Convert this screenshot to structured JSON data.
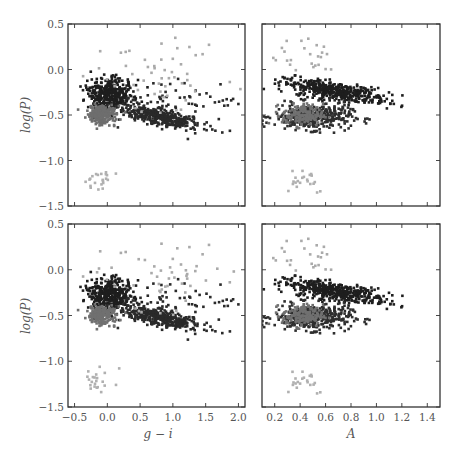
{
  "figure": {
    "clipped_top_text": [
      "y",
      "p"
    ]
  },
  "chart_data": {
    "type": "scatter",
    "layout": "2x2 grid, shared y-axis per row, shared x-axis per column",
    "grid": false,
    "legend": null,
    "panels": [
      {
        "id": "top-left",
        "xlabel": "g − i",
        "ylabel": "log(P)",
        "xlim": [
          -0.6,
          2.1
        ],
        "ylim": [
          -1.5,
          0.5
        ],
        "xticks": [
          -0.5,
          0.0,
          0.5,
          1.0,
          1.5,
          2.0
        ],
        "yticks": [
          -1.5,
          -1.0,
          -0.5,
          0.0,
          0.5
        ],
        "show_xticklabels": false,
        "show_yticklabels": true,
        "series": [
          {
            "name": "dark cluster A",
            "color": "#1e1e1e",
            "center": [
              0.05,
              -0.27
            ],
            "spread": [
              0.17,
              0.08
            ],
            "n": 420
          },
          {
            "name": "dark cluster B",
            "color": "#2a2a2a",
            "center": [
              0.8,
              -0.52
            ],
            "spread": [
              0.32,
              0.05
            ],
            "n": 380,
            "slope": -0.09
          },
          {
            "name": "dark sparse",
            "color": "#2a2a2a",
            "center": [
              1.1,
              -0.35
            ],
            "spread": [
              0.5,
              0.12
            ],
            "n": 60
          },
          {
            "name": "medium gray cluster",
            "color": "#6e6e6e",
            "center": [
              -0.1,
              -0.5
            ],
            "spread": [
              0.11,
              0.05
            ],
            "n": 220
          },
          {
            "name": "light gray sparse",
            "color": "#aaaaaa",
            "center": [
              0.9,
              -0.05
            ],
            "spread": [
              0.6,
              0.2
            ],
            "n": 55
          },
          {
            "name": "light gray low",
            "color": "#b0b0b0",
            "center": [
              -0.15,
              -1.2
            ],
            "spread": [
              0.15,
              0.07
            ],
            "n": 22
          }
        ]
      },
      {
        "id": "top-right",
        "xlabel": "A",
        "ylabel": "",
        "xlim": [
          0.1,
          1.5
        ],
        "ylim": [
          -1.5,
          0.5
        ],
        "xticks": [
          0.2,
          0.4,
          0.6,
          0.8,
          1.0,
          1.2,
          1.4
        ],
        "yticks": [
          -1.5,
          -1.0,
          -0.5,
          0.0,
          0.5
        ],
        "show_xticklabels": false,
        "show_yticklabels": false,
        "series": [
          {
            "name": "dark upper band",
            "color": "#1e1e1e",
            "center": [
              0.68,
              -0.24
            ],
            "spread": [
              0.2,
              0.05
            ],
            "n": 450,
            "slope": -0.08
          },
          {
            "name": "dark lower band",
            "color": "#2e2e2e",
            "center": [
              0.5,
              -0.52
            ],
            "spread": [
              0.15,
              0.07
            ],
            "n": 380
          },
          {
            "name": "medium gray cluster",
            "color": "#707070",
            "center": [
              0.42,
              -0.5
            ],
            "spread": [
              0.08,
              0.06
            ],
            "n": 160
          },
          {
            "name": "light gray sparse",
            "color": "#aaaaaa",
            "center": [
              0.45,
              0.15
            ],
            "spread": [
              0.15,
              0.15
            ],
            "n": 25
          },
          {
            "name": "light gray low",
            "color": "#b0b0b0",
            "center": [
              0.42,
              -1.2
            ],
            "spread": [
              0.1,
              0.08
            ],
            "n": 22
          }
        ]
      },
      {
        "id": "bottom-left",
        "xlabel": "g − i",
        "ylabel": "log(P)",
        "xlim": [
          -0.6,
          2.1
        ],
        "ylim": [
          -1.5,
          0.5
        ],
        "xticks": [
          -0.5,
          0.0,
          0.5,
          1.0,
          1.5,
          2.0
        ],
        "xticklabels": [
          "−0.5",
          "0.0",
          "0.5",
          "1.0",
          "1.5",
          "2.0"
        ],
        "yticks": [
          -1.5,
          -1.0,
          -0.5,
          0.0,
          0.5
        ],
        "show_xticklabels": true,
        "show_yticklabels": true,
        "series": [
          {
            "name": "dark cluster A",
            "color": "#1e1e1e",
            "center": [
              0.05,
              -0.27
            ],
            "spread": [
              0.17,
              0.08
            ],
            "n": 420
          },
          {
            "name": "dark cluster B",
            "color": "#2a2a2a",
            "center": [
              0.8,
              -0.52
            ],
            "spread": [
              0.32,
              0.05
            ],
            "n": 380,
            "slope": -0.09
          },
          {
            "name": "dark sparse",
            "color": "#2a2a2a",
            "center": [
              1.1,
              -0.35
            ],
            "spread": [
              0.5,
              0.12
            ],
            "n": 60
          },
          {
            "name": "medium gray cluster",
            "color": "#707070",
            "center": [
              -0.1,
              -0.5
            ],
            "spread": [
              0.11,
              0.05
            ],
            "n": 200
          },
          {
            "name": "light gray sparse",
            "color": "#aaaaaa",
            "center": [
              0.9,
              -0.05
            ],
            "spread": [
              0.6,
              0.2
            ],
            "n": 55
          },
          {
            "name": "light gray low",
            "color": "#b0b0b0",
            "center": [
              -0.15,
              -1.2
            ],
            "spread": [
              0.15,
              0.07
            ],
            "n": 22
          }
        ]
      },
      {
        "id": "bottom-right",
        "xlabel": "A",
        "ylabel": "",
        "xlim": [
          0.1,
          1.5
        ],
        "ylim": [
          -1.5,
          0.5
        ],
        "xticks": [
          0.2,
          0.4,
          0.6,
          0.8,
          1.0,
          1.2,
          1.4
        ],
        "xticklabels": [
          "0.2",
          "0.4",
          "0.6",
          "0.8",
          "1.0",
          "1.2",
          "1.4"
        ],
        "yticks": [
          -1.5,
          -1.0,
          -0.5,
          0.0,
          0.5
        ],
        "show_xticklabels": true,
        "show_yticklabels": false,
        "series": [
          {
            "name": "dark upper band",
            "color": "#1e1e1e",
            "center": [
              0.68,
              -0.24
            ],
            "spread": [
              0.2,
              0.05
            ],
            "n": 450,
            "slope": -0.08
          },
          {
            "name": "dark lower band",
            "color": "#2e2e2e",
            "center": [
              0.5,
              -0.52
            ],
            "spread": [
              0.15,
              0.07
            ],
            "n": 380
          },
          {
            "name": "medium gray cluster",
            "color": "#707070",
            "center": [
              0.42,
              -0.5
            ],
            "spread": [
              0.08,
              0.06
            ],
            "n": 160
          },
          {
            "name": "light gray sparse",
            "color": "#aaaaaa",
            "center": [
              0.45,
              0.15
            ],
            "spread": [
              0.15,
              0.15
            ],
            "n": 25
          },
          {
            "name": "light gray low",
            "color": "#b0b0b0",
            "center": [
              0.42,
              -1.2
            ],
            "spread": [
              0.1,
              0.08
            ],
            "n": 22
          }
        ]
      }
    ],
    "yticklabels": [
      "−1.5",
      "−1.0",
      "−0.5",
      "0.0",
      "0.5"
    ],
    "xlabel_left": "g − i",
    "xlabel_right": "A",
    "ylabel": "log(P)"
  }
}
